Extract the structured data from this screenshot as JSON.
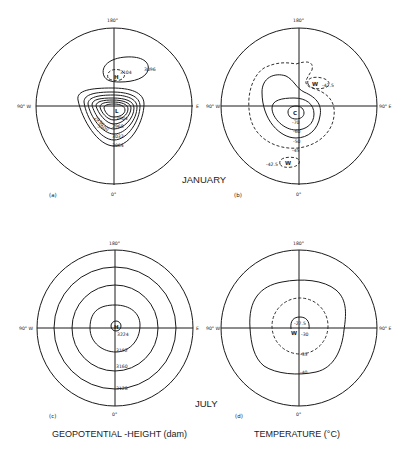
{
  "figure": {
    "season_labels": {
      "january": "JANUARY",
      "july": "JULY"
    },
    "column_captions": {
      "left": "GEOPOTENTIAL -HEIGHT (dam)",
      "right": "TEMPERATURE (°C)"
    },
    "panels": [
      {
        "id": "a",
        "label": "(a)",
        "month": "January",
        "variable": "geopotential height",
        "axis_labels": {
          "top": "180°",
          "bottom": "0°",
          "left": "90° W",
          "right": "E"
        },
        "centers": [
          {
            "symbol": "L"
          },
          {
            "symbol": "H"
          }
        ],
        "contour_labels": [
          "3104",
          "3096",
          "2904",
          "2936",
          "2968",
          "3000",
          "3032",
          "3064"
        ]
      },
      {
        "id": "b",
        "label": "(b)",
        "month": "January",
        "variable": "temperature",
        "axis_labels": {
          "top": "180°",
          "bottom": "0°",
          "left": "90° W",
          "right": "90° E"
        },
        "centers": [
          {
            "symbol": "C"
          },
          {
            "symbol": "W",
            "value": "-42.5"
          },
          {
            "symbol": "W",
            "value": "-42.5"
          }
        ],
        "contour_labels": [
          "-70",
          "-60",
          "-50",
          "-45",
          "-42.5",
          "-42.5"
        ]
      },
      {
        "id": "c",
        "label": "(c)",
        "month": "July",
        "variable": "geopotential height",
        "axis_labels": {
          "top": "180°",
          "bottom": "0°",
          "left": "90° W",
          "right": "E"
        },
        "centers": [
          {
            "symbol": "H"
          }
        ],
        "contour_labels": [
          "3224",
          "3192",
          "3160",
          "3128"
        ]
      },
      {
        "id": "d",
        "label": "(d)",
        "month": "July",
        "variable": "temperature",
        "axis_labels": {
          "top": "180°",
          "bottom": "0°",
          "left": "90° W",
          "right": "90° E"
        },
        "centers": [
          {
            "symbol": "W"
          }
        ],
        "contour_labels": [
          "-27.5",
          "-30",
          "-35",
          "-40"
        ]
      }
    ]
  }
}
